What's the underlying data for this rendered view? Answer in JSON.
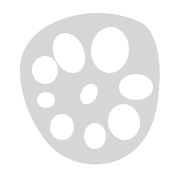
{
  "image": {
    "subject": "lotus root cross-section",
    "colors": {
      "background": "#ffffff",
      "body": "#d6d6d6",
      "holes": "#ffffff"
    },
    "outline_path": "M 60 20 C 85 10, 120 10, 145 25 C 160 40, 162 70, 158 100 C 154 130, 140 155, 110 163 C 85 168, 60 160, 45 140 C 30 120, 20 95, 20 70 C 20 45, 38 28, 60 20 Z",
    "holes": [
      {
        "cx": 69,
        "cy": 53,
        "rx": 15,
        "ry": 21,
        "rot": -25
      },
      {
        "cx": 110,
        "cy": 50,
        "rx": 19,
        "ry": 23,
        "rot": 5
      },
      {
        "cx": 45,
        "cy": 70,
        "rx": 13,
        "ry": 14,
        "rot": 0
      },
      {
        "cx": 136,
        "cy": 87,
        "rx": 17,
        "ry": 13,
        "rot": 0
      },
      {
        "cx": 46,
        "cy": 100,
        "rx": 9,
        "ry": 8,
        "rot": 0
      },
      {
        "cx": 89,
        "cy": 94,
        "rx": 8,
        "ry": 11,
        "rot": 30
      },
      {
        "cx": 62,
        "cy": 127,
        "rx": 12,
        "ry": 13,
        "rot": 0
      },
      {
        "cx": 95,
        "cy": 136,
        "rx": 11,
        "ry": 13,
        "rot": 0
      },
      {
        "cx": 124,
        "cy": 122,
        "rx": 16,
        "ry": 18,
        "rot": -10
      }
    ]
  }
}
